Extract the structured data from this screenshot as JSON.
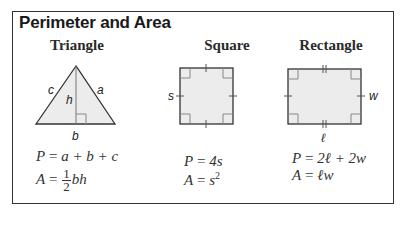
{
  "title": "Perimeter and Area",
  "shapes": [
    {
      "name": "Triangle",
      "labels": {
        "side_left": "c",
        "side_right": "a",
        "height": "h",
        "base": "b"
      },
      "perimeter": {
        "lhs": "P",
        "rhs": "a + b + c"
      },
      "area": {
        "lhs": "A",
        "numerator": "1",
        "denominator": "2",
        "rhs": "bh"
      }
    },
    {
      "name": "Square",
      "labels": {
        "side": "s"
      },
      "perimeter": {
        "lhs": "P",
        "rhs": "4s"
      },
      "area": {
        "lhs": "A",
        "rhs": "s",
        "exponent": "2"
      }
    },
    {
      "name": "Rectangle",
      "labels": {
        "width": "w",
        "length": "ℓ"
      },
      "perimeter": {
        "lhs": "P",
        "rhs": "2ℓ + 2w"
      },
      "area": {
        "lhs": "A",
        "rhs": "ℓw"
      }
    }
  ],
  "colors": {
    "fill": "#ececec",
    "stroke": "#333333",
    "right_angle": "#888888"
  }
}
